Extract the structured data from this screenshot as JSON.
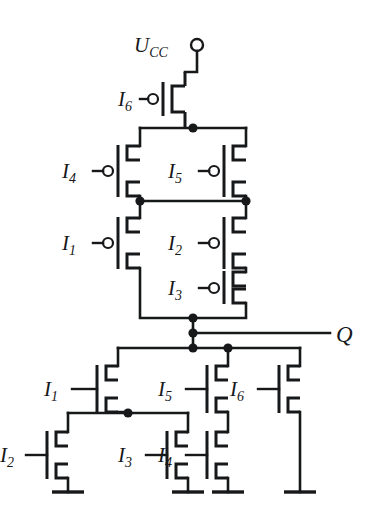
{
  "figure": {
    "kind": "cmos-circuit-schematic",
    "background_color": "#ffffff",
    "line_color": "#17181a",
    "width": 378,
    "height": 515
  },
  "labels": {
    "supply": {
      "base": "U",
      "sub": "CC",
      "full": "Ucc"
    },
    "output": {
      "text": "Q"
    },
    "pmos": {
      "p1": {
        "base": "I",
        "sub": "1"
      },
      "p2": {
        "base": "I",
        "sub": "2"
      },
      "p3": {
        "base": "I",
        "sub": "3"
      },
      "p4": {
        "base": "I",
        "sub": "4"
      },
      "p5": {
        "base": "I",
        "sub": "5"
      },
      "p6": {
        "base": "I",
        "sub": "6"
      }
    },
    "nmos": {
      "n1": {
        "base": "I",
        "sub": "1"
      },
      "n2": {
        "base": "I",
        "sub": "2"
      },
      "n3": {
        "base": "I",
        "sub": "3"
      },
      "n4": {
        "base": "I",
        "sub": "4"
      },
      "n5": {
        "base": "I",
        "sub": "5"
      },
      "n6": {
        "base": "I",
        "sub": "6"
      }
    }
  },
  "terminals": {
    "supply_node": {
      "x": 197,
      "y": 45,
      "style": "open-circle"
    },
    "output_label": {
      "x": 340,
      "y": 333
    }
  },
  "grounds": [
    {
      "name": "gnd-n2",
      "x": 68
    },
    {
      "name": "gnd-n3",
      "x": 128
    },
    {
      "name": "gnd-n4",
      "x": 228
    },
    {
      "name": "gnd-n6",
      "x": 300
    }
  ],
  "junction_dots": [
    {
      "name": "node-pmos-top-rail",
      "x": 193,
      "y": 128
    },
    {
      "name": "node-p4-p1-left",
      "x": 140,
      "y": 201
    },
    {
      "name": "node-p5-p2-right",
      "x": 230,
      "y": 201
    },
    {
      "name": "node-pmos-drain",
      "x": 193,
      "y": 318
    },
    {
      "name": "node-output-q",
      "x": 193,
      "y": 333
    },
    {
      "name": "node-nmos-rail",
      "x": 193,
      "y": 348
    },
    {
      "name": "node-n5-branch",
      "x": 228,
      "y": 348
    },
    {
      "name": "node-n1-source",
      "x": 128,
      "y": 413
    }
  ]
}
